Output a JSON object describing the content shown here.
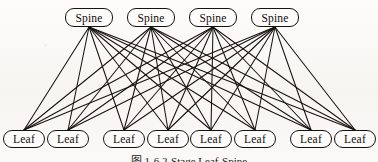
{
  "figure": {
    "caption": "图 1-6    2-Stage Leaf-Spine",
    "background_color": "#fbfaf8",
    "ink_color": "#16130f"
  },
  "diagram": {
    "type": "bipartite-network-topology",
    "spine_label": "Spine",
    "leaf_label": "Leaf",
    "spine_count": 4,
    "leaf_count": 8,
    "edge_count": 32,
    "spines": [
      {
        "id": "spine-1",
        "label": "Spine",
        "x": 65,
        "y": 8,
        "w": 48,
        "h": 19
      },
      {
        "id": "spine-2",
        "label": "Spine",
        "x": 127,
        "y": 8,
        "w": 48,
        "h": 19
      },
      {
        "id": "spine-3",
        "label": "Spine",
        "x": 189,
        "y": 8,
        "w": 48,
        "h": 19
      },
      {
        "id": "spine-4",
        "label": "Spine",
        "x": 251,
        "y": 8,
        "w": 48,
        "h": 19
      }
    ],
    "leaves": [
      {
        "id": "leaf-1",
        "label": "Leaf",
        "x": 3,
        "y": 130,
        "w": 42,
        "h": 18
      },
      {
        "id": "leaf-2",
        "label": "Leaf",
        "x": 47,
        "y": 130,
        "w": 42,
        "h": 18
      },
      {
        "id": "leaf-3",
        "label": "Leaf",
        "x": 103,
        "y": 130,
        "w": 42,
        "h": 18
      },
      {
        "id": "leaf-4",
        "label": "Leaf",
        "x": 147,
        "y": 130,
        "w": 42,
        "h": 18
      },
      {
        "id": "leaf-5",
        "label": "Leaf",
        "x": 190,
        "y": 130,
        "w": 42,
        "h": 18
      },
      {
        "id": "leaf-6",
        "label": "Leaf",
        "x": 234,
        "y": 130,
        "w": 42,
        "h": 18
      },
      {
        "id": "leaf-7",
        "label": "Leaf",
        "x": 290,
        "y": 130,
        "w": 42,
        "h": 18
      },
      {
        "id": "leaf-8",
        "label": "Leaf",
        "x": 334,
        "y": 130,
        "w": 42,
        "h": 18
      }
    ],
    "edges": [
      [
        "spine-1",
        "leaf-1"
      ],
      [
        "spine-1",
        "leaf-2"
      ],
      [
        "spine-1",
        "leaf-3"
      ],
      [
        "spine-1",
        "leaf-4"
      ],
      [
        "spine-1",
        "leaf-5"
      ],
      [
        "spine-1",
        "leaf-6"
      ],
      [
        "spine-1",
        "leaf-7"
      ],
      [
        "spine-1",
        "leaf-8"
      ],
      [
        "spine-2",
        "leaf-1"
      ],
      [
        "spine-2",
        "leaf-2"
      ],
      [
        "spine-2",
        "leaf-3"
      ],
      [
        "spine-2",
        "leaf-4"
      ],
      [
        "spine-2",
        "leaf-5"
      ],
      [
        "spine-2",
        "leaf-6"
      ],
      [
        "spine-2",
        "leaf-7"
      ],
      [
        "spine-2",
        "leaf-8"
      ],
      [
        "spine-3",
        "leaf-1"
      ],
      [
        "spine-3",
        "leaf-2"
      ],
      [
        "spine-3",
        "leaf-3"
      ],
      [
        "spine-3",
        "leaf-4"
      ],
      [
        "spine-3",
        "leaf-5"
      ],
      [
        "spine-3",
        "leaf-6"
      ],
      [
        "spine-3",
        "leaf-7"
      ],
      [
        "spine-3",
        "leaf-8"
      ],
      [
        "spine-4",
        "leaf-1"
      ],
      [
        "spine-4",
        "leaf-2"
      ],
      [
        "spine-4",
        "leaf-3"
      ],
      [
        "spine-4",
        "leaf-4"
      ],
      [
        "spine-4",
        "leaf-5"
      ],
      [
        "spine-4",
        "leaf-6"
      ],
      [
        "spine-4",
        "leaf-7"
      ],
      [
        "spine-4",
        "leaf-8"
      ]
    ]
  }
}
